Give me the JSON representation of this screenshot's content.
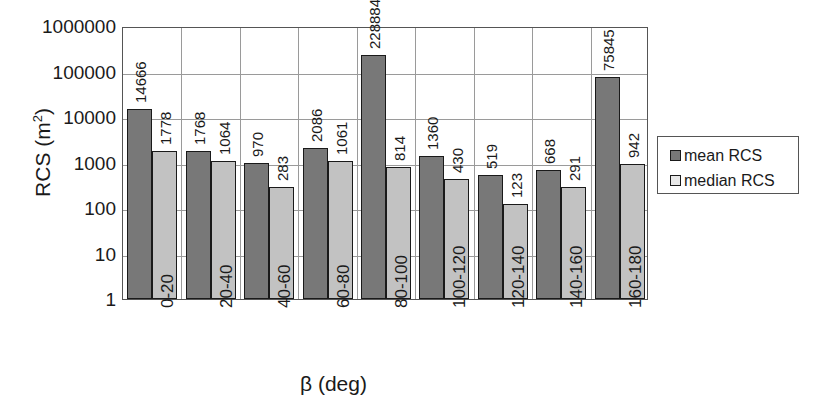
{
  "chart_data": {
    "type": "bar",
    "title": "",
    "subtitle": "",
    "xlabel": "β (deg)",
    "ylabel": "RCS (m²)",
    "ylabel_base": "RCS (m",
    "ylabel_sup": "2",
    "ylabel_close": ")",
    "yscale": "log",
    "ylim": [
      1,
      1000000
    ],
    "ytick_labels": [
      "1000000",
      "100000",
      "10000",
      "1000",
      "100",
      "10",
      "1"
    ],
    "ytick_values": [
      1000000,
      100000,
      10000,
      1000,
      100,
      10,
      1
    ],
    "grid": "horizontal-and-vertical",
    "legend_position": "right",
    "categories": [
      "0-20",
      "20-40",
      "40-60",
      "60-80",
      "80-100",
      "100-120",
      "120-140",
      "140-160",
      "160-180"
    ],
    "series": [
      {
        "name": "mean RCS",
        "color": "#787878",
        "values": [
          14666,
          1768,
          970,
          2086,
          228884,
          1360,
          519,
          668,
          75845
        ],
        "labels": [
          "14666",
          "1768",
          "970",
          "2086",
          "228884",
          "1360",
          "519",
          "668",
          "75845"
        ]
      },
      {
        "name": "median RCS",
        "color": "#c2c2c2",
        "values": [
          1778,
          1064,
          283,
          1061,
          814,
          430,
          123,
          291,
          942
        ],
        "labels": [
          "1778",
          "1064",
          "283",
          "1061",
          "814",
          "430",
          "123",
          "291",
          "942"
        ]
      }
    ]
  },
  "legend": {
    "items": [
      {
        "label": "mean RCS",
        "swatch": "dark-gray-swatch"
      },
      {
        "label": "median RCS",
        "swatch": "light-gray-swatch"
      }
    ]
  },
  "axes": {
    "y_title": "RCS (m²)",
    "x_title": "β (deg)"
  }
}
